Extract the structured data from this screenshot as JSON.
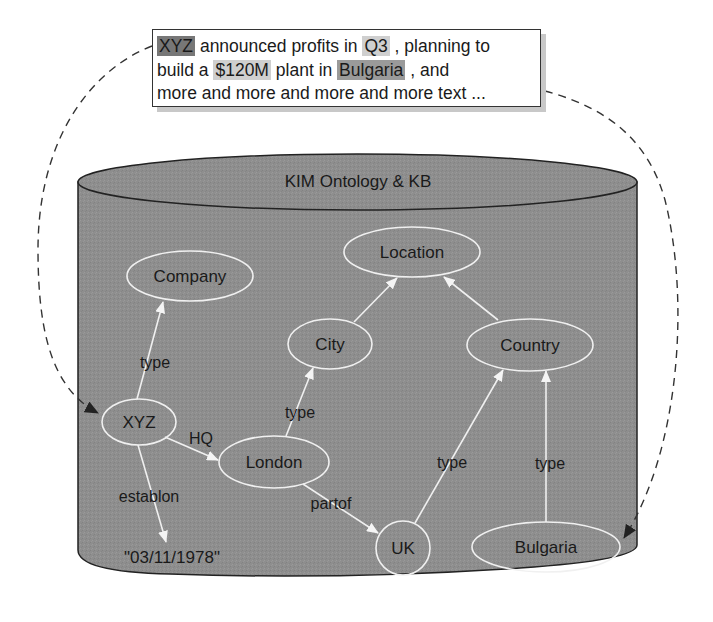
{
  "text_box": {
    "line1": {
      "entity_xyz": "XYZ",
      "t1": " announced profits in ",
      "entity_q3": "Q3",
      "t2": " , planning to"
    },
    "line2": {
      "t1": "build a ",
      "entity_money": "$120M",
      "t2": " plant in ",
      "entity_bulgaria": "Bulgaria",
      "t3": " ,  and"
    },
    "line3": "more and more and more and more text ..."
  },
  "knowledge_base": {
    "title": "KIM Ontology & KB",
    "fill_color": "#8c8c8c",
    "edge_color": "#f0f0f0",
    "nodes": [
      {
        "id": "company",
        "label": "Company"
      },
      {
        "id": "location",
        "label": "Location"
      },
      {
        "id": "city",
        "label": "City"
      },
      {
        "id": "country",
        "label": "Country"
      },
      {
        "id": "xyz",
        "label": "XYZ"
      },
      {
        "id": "london",
        "label": "London"
      },
      {
        "id": "uk",
        "label": "UK"
      },
      {
        "id": "bulgaria",
        "label": "Bulgaria"
      },
      {
        "id": "date",
        "label": "\"03/11/1978\""
      }
    ],
    "edges": [
      {
        "from": "xyz",
        "to": "company",
        "label": "type"
      },
      {
        "from": "xyz",
        "to": "london",
        "label": "HQ"
      },
      {
        "from": "london",
        "to": "city",
        "label": "type"
      },
      {
        "from": "xyz",
        "to": "date",
        "label": "establon"
      },
      {
        "from": "london",
        "to": "uk",
        "label": "partof"
      },
      {
        "from": "uk",
        "to": "country",
        "label": "type"
      },
      {
        "from": "bulgaria",
        "to": "country",
        "label": "type"
      },
      {
        "from": "city",
        "to": "location",
        "label": ""
      },
      {
        "from": "country",
        "to": "location",
        "label": ""
      }
    ]
  },
  "annotations": [
    {
      "from": "text:XYZ",
      "to": "node:xyz",
      "style": "dashed"
    },
    {
      "from": "text:Bulgaria",
      "to": "node:bulgaria",
      "style": "dashed"
    }
  ]
}
